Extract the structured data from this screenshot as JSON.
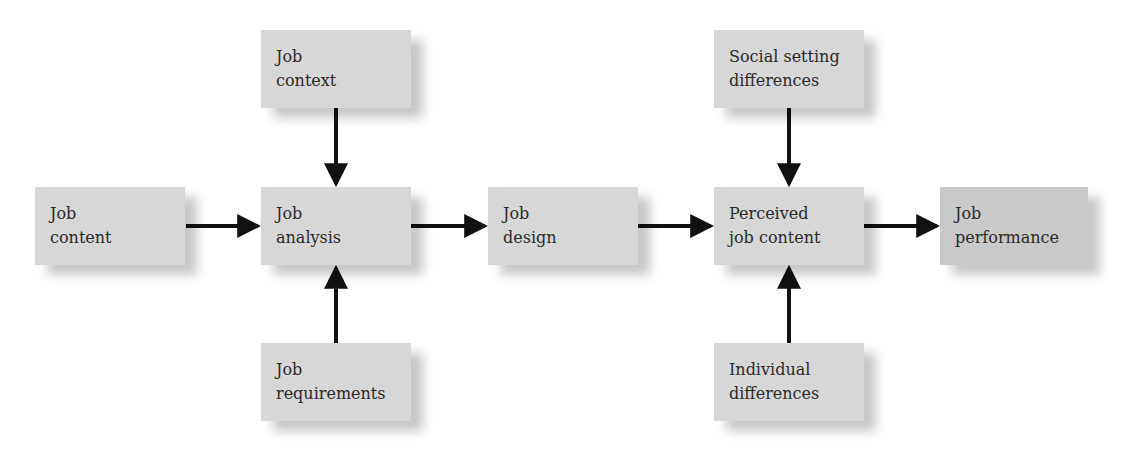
{
  "diagram": {
    "nodes": [
      {
        "id": "job_content",
        "line1": "Job",
        "line2": "content"
      },
      {
        "id": "job_context",
        "line1": "Job",
        "line2": "context"
      },
      {
        "id": "job_analysis",
        "line1": "Job",
        "line2": "analysis"
      },
      {
        "id": "job_requirements",
        "line1": "Job",
        "line2": "requirements"
      },
      {
        "id": "job_design",
        "line1": "Job",
        "line2": "design"
      },
      {
        "id": "social_setting_differences",
        "line1": "Social setting",
        "line2": "differences"
      },
      {
        "id": "perceived_job_content",
        "line1": "Perceived",
        "line2": "job content"
      },
      {
        "id": "individual_differences",
        "line1": "Individual",
        "line2": "differences"
      },
      {
        "id": "job_performance",
        "line1": "Job",
        "line2": "performance"
      }
    ],
    "edges": [
      {
        "from": "job_content",
        "to": "job_analysis"
      },
      {
        "from": "job_context",
        "to": "job_analysis"
      },
      {
        "from": "job_requirements",
        "to": "job_analysis"
      },
      {
        "from": "job_analysis",
        "to": "job_design"
      },
      {
        "from": "job_design",
        "to": "perceived_job_content"
      },
      {
        "from": "social_setting_differences",
        "to": "perceived_job_content"
      },
      {
        "from": "individual_differences",
        "to": "perceived_job_content"
      },
      {
        "from": "perceived_job_content",
        "to": "job_performance"
      }
    ],
    "colors": {
      "box_fill": "#d7d7d7",
      "box_fill_output": "#c9c9c9",
      "arrow": "#111111",
      "text": "#2a2a2a"
    }
  }
}
